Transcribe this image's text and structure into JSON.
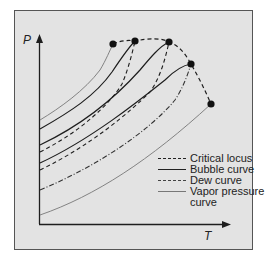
{
  "diagram": {
    "axes": {
      "y_label": "P",
      "x_label": "T"
    },
    "legend": [
      {
        "style": "dashed",
        "label": "Critical locus"
      },
      {
        "style": "solid",
        "label": "Bubble curve"
      },
      {
        "style": "dash-dot",
        "label": "Dew curve"
      },
      {
        "style": "thin-gray",
        "label": "Vapor pressure"
      },
      {
        "style": "continuation",
        "label": "curve"
      }
    ],
    "critical_points": [
      {
        "x": 113,
        "y": 44
      },
      {
        "x": 135,
        "y": 41
      },
      {
        "x": 169,
        "y": 42
      },
      {
        "x": 191,
        "y": 64
      },
      {
        "x": 211,
        "y": 104
      }
    ],
    "colors": {
      "background": "#e3e3e3",
      "ink": "#1e1e1e",
      "vapor": "#777777"
    }
  }
}
